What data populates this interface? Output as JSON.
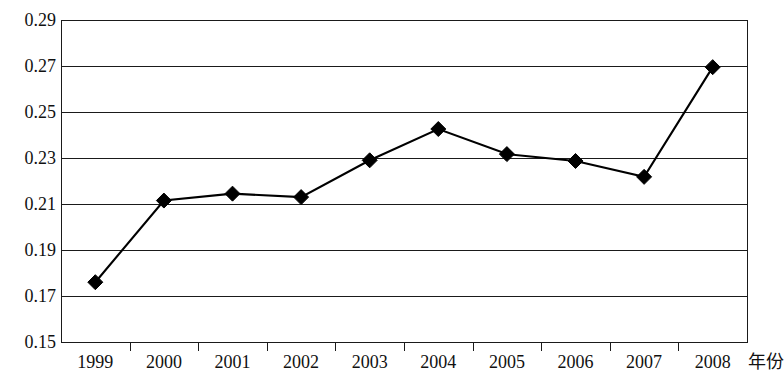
{
  "chart_data": {
    "type": "line",
    "title": "",
    "subtitle": "",
    "xlabel": "年份",
    "ylabel": "",
    "categories": [
      "1999",
      "2000",
      "2001",
      "2002",
      "2003",
      "2004",
      "2005",
      "2006",
      "2007",
      "2008"
    ],
    "values": [
      0.176,
      0.2115,
      0.2145,
      0.213,
      0.229,
      0.2426,
      0.2317,
      0.2287,
      0.2218,
      0.2695
    ],
    "series": [
      {
        "name": "",
        "values": [
          0.176,
          0.2115,
          0.2145,
          0.213,
          0.229,
          0.2426,
          0.2317,
          0.2287,
          0.2218,
          0.2695
        ]
      }
    ],
    "ylim": [
      0.15,
      0.29
    ],
    "ytick_step": 0.02,
    "yticks": [
      "0.29",
      "0.27",
      "0.25",
      "0.23",
      "0.21",
      "0.19",
      "0.17",
      "0.15"
    ],
    "ytick_values": [
      0.29,
      0.27,
      0.25,
      0.23,
      0.21,
      0.19,
      0.17,
      0.15
    ],
    "grid": true,
    "grid_axis": "y",
    "legend": false,
    "legend_position": "none",
    "marker": "diamond",
    "line_color": "#000000",
    "marker_color": "#000000",
    "grid_color": "#1a1a1a",
    "frame_color": "#1a1a1a",
    "background": "#ffffff",
    "annotations": []
  }
}
